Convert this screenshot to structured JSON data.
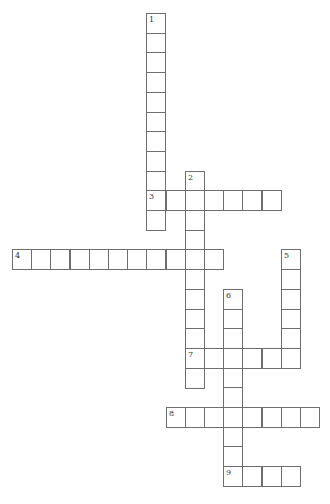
{
  "puzzle": {
    "type": "crossword",
    "cell_size": 19.2,
    "row_height": 19.7,
    "origin_x": 12,
    "origin_y": 13,
    "border_color": "#6e6e6e",
    "words": [
      {
        "number": "1",
        "direction": "down",
        "col": 7,
        "row": 0,
        "length": 11
      },
      {
        "number": "2",
        "direction": "down",
        "col": 9,
        "row": 8,
        "length": 11
      },
      {
        "number": "3",
        "direction": "across",
        "col": 7,
        "row": 9,
        "length": 7
      },
      {
        "number": "4",
        "direction": "across",
        "col": 0,
        "row": 12,
        "length": 11
      },
      {
        "number": "5",
        "direction": "down",
        "col": 14,
        "row": 12,
        "length": 6
      },
      {
        "number": "6",
        "direction": "down",
        "col": 11,
        "row": 14,
        "length": 10
      },
      {
        "number": "7",
        "direction": "across",
        "col": 9,
        "row": 17,
        "length": 6
      },
      {
        "number": "8",
        "direction": "across",
        "col": 8,
        "row": 20,
        "length": 8
      },
      {
        "number": "9",
        "direction": "across",
        "col": 11,
        "row": 23,
        "length": 4
      }
    ]
  }
}
